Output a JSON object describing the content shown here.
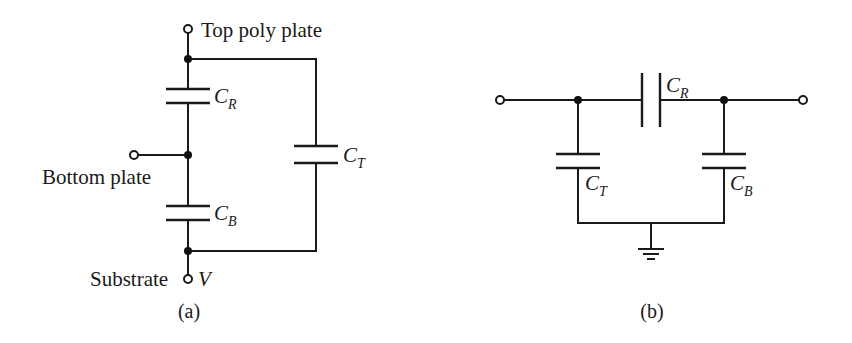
{
  "figure_a": {
    "caption": "(a)",
    "terminals": {
      "top": "Top poly plate",
      "bottom_plate": "Bottom plate",
      "substrate": "Substrate",
      "substrate_voltage": "V"
    },
    "capacitors": [
      {
        "id": "CR",
        "symbol": "C",
        "subscript": "R"
      },
      {
        "id": "CB",
        "symbol": "C",
        "subscript": "B"
      },
      {
        "id": "CT",
        "symbol": "C",
        "subscript": "T"
      }
    ]
  },
  "figure_b": {
    "caption": "(b)",
    "capacitors": [
      {
        "id": "CR",
        "symbol": "C",
        "subscript": "R"
      },
      {
        "id": "CT",
        "symbol": "C",
        "subscript": "T"
      },
      {
        "id": "CB",
        "symbol": "C",
        "subscript": "B"
      }
    ],
    "ground": "ground-symbol"
  },
  "colors": {
    "line": "#1a1a1a",
    "background": "#ffffff"
  }
}
